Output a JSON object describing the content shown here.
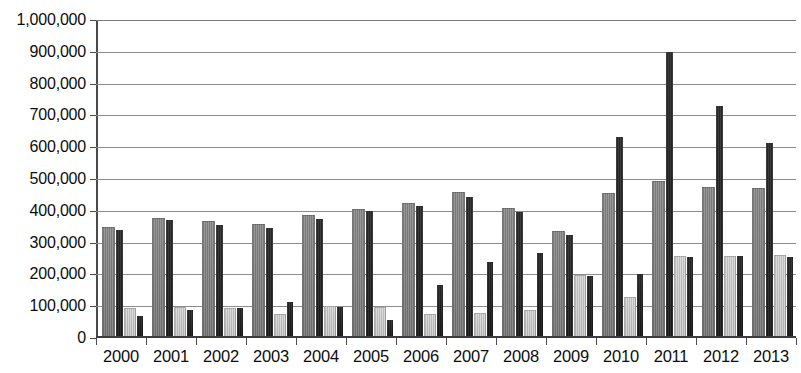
{
  "chart_data": {
    "type": "bar",
    "title": "",
    "xlabel": "",
    "ylabel": "",
    "ylim": [
      0,
      1000000
    ],
    "ytick_step": 100000,
    "grid": true,
    "legend": "none",
    "categories": [
      "2000",
      "2001",
      "2002",
      "2003",
      "2004",
      "2005",
      "2006",
      "2007",
      "2008",
      "2009",
      "2010",
      "2011",
      "2012",
      "2013"
    ],
    "ytick_labels": [
      "1,000,000",
      "900,000",
      "800,000",
      "700,000",
      "600,000",
      "500,000",
      "400,000",
      "300,000",
      "200,000",
      "100,000",
      "0"
    ],
    "ytick_values": [
      1000000,
      900000,
      800000,
      700000,
      600000,
      500000,
      400000,
      300000,
      200000,
      100000,
      0
    ],
    "series": [
      {
        "name": "series-1",
        "color": "#7d7d7d",
        "values": [
          350000,
          378000,
          368000,
          358000,
          388000,
          405000,
          425000,
          458000,
          408000,
          338000,
          455000,
          495000,
          475000,
          472000
        ]
      },
      {
        "name": "series-2",
        "color": "#232323",
        "values": [
          340000,
          370000,
          355000,
          345000,
          375000,
          398000,
          415000,
          445000,
          395000,
          325000,
          632000,
          898000,
          730000,
          612000
        ]
      },
      {
        "name": "series-3",
        "color": "#c5c5c5",
        "values": [
          95000,
          98000,
          95000,
          75000,
          100000,
          98000,
          75000,
          80000,
          88000,
          198000,
          128000,
          258000,
          258000,
          262000
        ]
      },
      {
        "name": "series-4",
        "color": "#202020",
        "values": [
          70000,
          88000,
          95000,
          112000,
          98000,
          58000,
          168000,
          240000,
          268000,
          195000,
          202000,
          255000,
          258000,
          255000
        ]
      }
    ]
  }
}
